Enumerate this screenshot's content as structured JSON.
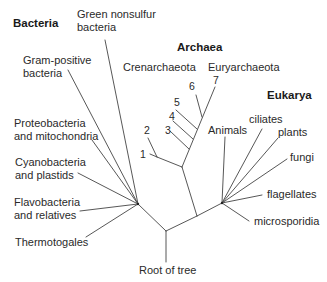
{
  "diagram": {
    "domains": {
      "bacteria": "Bacteria",
      "archaea": "Archaea",
      "eukarya": "Eukarya"
    },
    "bacteria": {
      "green_nonsulfur_1": "Green nonsulfur",
      "green_nonsulfur_2": "bacteria",
      "gram_positive_1": "Gram-positive",
      "gram_positive_2": "bacteria",
      "proteobacteria_1": "Proteobacteria",
      "proteobacteria_2": "and mitochondria",
      "cyanobacteria_1": "Cyanobacteria",
      "cyanobacteria_2": "and plastids",
      "flavobacteria_1": "Flavobacteria",
      "flavobacteria_2": "and relatives",
      "thermotogales": "Thermotogales"
    },
    "archaea": {
      "crenarchaeota": "Crenarchaeota",
      "euryarchaeota": "Euryarchaeota",
      "numbers": [
        "1",
        "2",
        "3",
        "4",
        "5",
        "6",
        "7"
      ]
    },
    "eukarya": {
      "animals": "Animals",
      "ciliates": "ciliates",
      "plants": "plants",
      "fungi": "fungi",
      "flagellates": "flagellates",
      "microsporidia": "microsporidia"
    },
    "root": "Root of tree",
    "line_color": "#444444"
  }
}
